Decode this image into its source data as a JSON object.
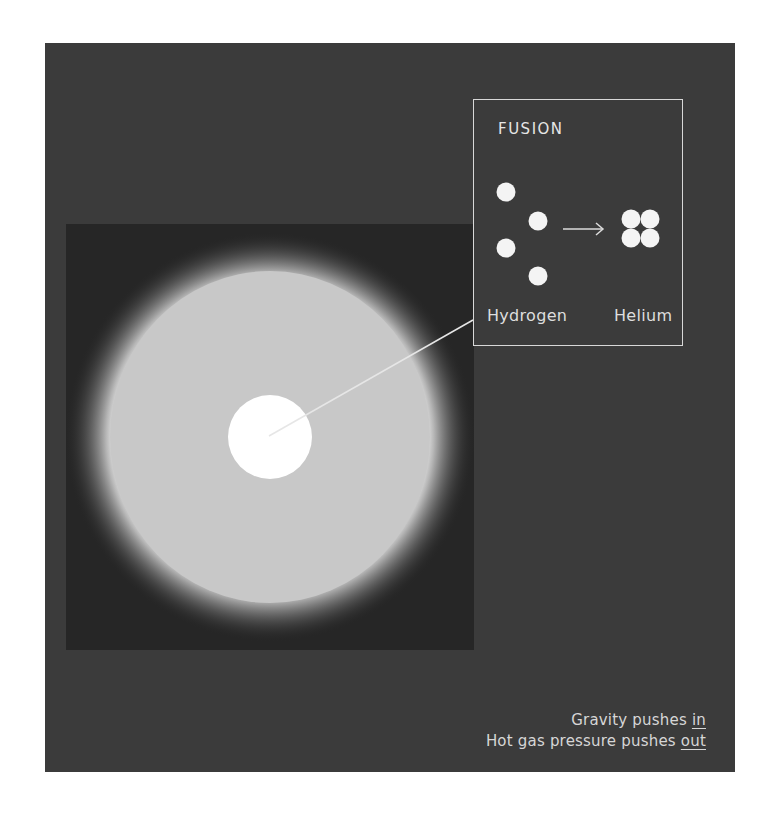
{
  "fusion_box": {
    "title": "FUSION",
    "reactant_label": "Hydrogen",
    "product_label": "Helium",
    "arrow_icon": "right-arrow-icon",
    "hydrogen_atom_count": 4,
    "helium_nucleus_count": 4
  },
  "captions": {
    "line1_prefix": "Gravity pushes ",
    "line1_emphasis": "in",
    "line2_prefix": "Hot gas pressure pushes ",
    "line2_emphasis": "out"
  },
  "colors": {
    "panel_background": "#3b3b3b",
    "inner_square": "#262626",
    "star_envelope": "#c8c8c8",
    "star_core": "#ffffff",
    "line_and_text": "#e0e0e0"
  }
}
